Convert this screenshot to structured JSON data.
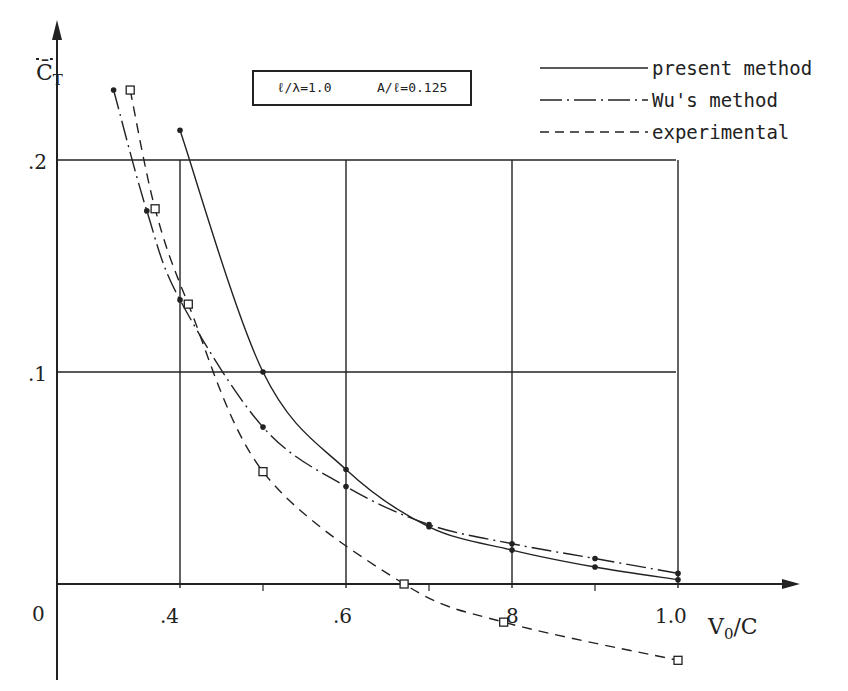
{
  "chart_data": {
    "type": "line",
    "title": "",
    "xlabel": "V0/C",
    "ylabel": "C̄T",
    "xlim": [
      0.25,
      1.1
    ],
    "ylim": [
      -0.04,
      0.25
    ],
    "grid": true,
    "x_ticks": [
      ".4",
      ".6",
      "8",
      "1.0"
    ],
    "x_tick_values": [
      0.4,
      0.6,
      0.8,
      1.0
    ],
    "y_ticks": [
      ".1",
      ".2"
    ],
    "y_tick_values": [
      0.1,
      0.2
    ],
    "origin_label": "0",
    "annotation": "ℓ/λ=1.0    A/ℓ=0.125",
    "legend_position": "top-right",
    "series": [
      {
        "name": "present method",
        "style": "solid",
        "marker": "dot",
        "x": [
          0.4,
          0.5,
          0.6,
          0.7,
          0.8,
          0.9,
          1.0
        ],
        "y": [
          0.214,
          0.1,
          0.054,
          0.027,
          0.016,
          0.008,
          0.002
        ]
      },
      {
        "name": "Wu's method",
        "style": "dash-dot",
        "marker": "dot",
        "x": [
          0.32,
          0.36,
          0.4,
          0.5,
          0.6,
          0.7,
          0.8,
          0.9,
          1.0
        ],
        "y": [
          0.233,
          0.176,
          0.134,
          0.074,
          0.046,
          0.028,
          0.019,
          0.012,
          0.005
        ]
      },
      {
        "name": "experimental",
        "style": "dashed",
        "marker": "square",
        "x": [
          0.34,
          0.37,
          0.41,
          0.5,
          0.67,
          0.79,
          1.0
        ],
        "y": [
          0.233,
          0.177,
          0.132,
          0.053,
          0.0,
          -0.018,
          -0.036
        ]
      }
    ]
  },
  "labels": {
    "y_axis": "C̄",
    "y_axis_sub": "T",
    "x_axis": "V",
    "x_axis_sub": "0",
    "x_axis_tail": "/C",
    "origin": "0",
    "y_tick_1": ".1",
    "y_tick_2": ".2",
    "x_tick_04": ".4",
    "x_tick_06": ".6",
    "x_tick_08": "8",
    "x_tick_10": "1.0"
  },
  "param_box": {
    "ratio1": "ℓ/λ=1.0",
    "ratio2": "A/ℓ=0.125"
  },
  "legend": {
    "present": "present method",
    "wu": "Wu's method",
    "experimental": "experimental"
  }
}
